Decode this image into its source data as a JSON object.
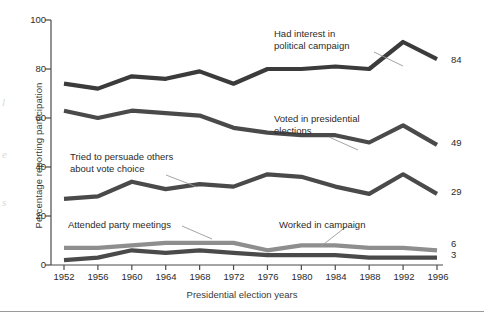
{
  "chart_data": {
    "type": "line",
    "title": "",
    "xlabel": "Presidential election years",
    "ylabel": "Percentage reporting participation",
    "categories": [
      "1952",
      "1956",
      "1960",
      "1964",
      "1968",
      "1972",
      "1976",
      "1980",
      "1984",
      "1988",
      "1992",
      "1996"
    ],
    "x": [
      1952,
      1956,
      1960,
      1964,
      1968,
      1972,
      1976,
      1980,
      1984,
      1988,
      1992,
      1996
    ],
    "ylim": [
      0,
      100
    ],
    "xlim": [
      1952,
      1996
    ],
    "yticks": [
      0,
      20,
      40,
      60,
      80,
      100
    ],
    "ytick_labels": [
      "0",
      "20",
      "40",
      "60",
      "80",
      "100"
    ],
    "grid": false,
    "legend_position": "inline-annotations",
    "series": [
      {
        "name": "Had interest in political campaign",
        "color": "#3b3b3b",
        "values": [
          74,
          72,
          77,
          76,
          79,
          74,
          80,
          80,
          81,
          80,
          91,
          84
        ],
        "end_label": "84"
      },
      {
        "name": "Voted in presidential elections",
        "color": "#4a4a4a",
        "values": [
          63,
          60,
          63,
          62,
          61,
          56,
          54,
          53,
          53,
          50,
          57,
          49
        ],
        "end_label": "49"
      },
      {
        "name": "Tried to persuade others about vote choice",
        "color": "#4a4a4a",
        "values": [
          27,
          28,
          34,
          31,
          33,
          32,
          37,
          36,
          32,
          29,
          37,
          29
        ],
        "end_label": "29"
      },
      {
        "name": "Attended party meetings",
        "color": "#8e8e8e",
        "values": [
          7,
          7,
          8,
          9,
          9,
          9,
          6,
          8,
          8,
          7,
          7,
          6
        ],
        "end_label": "6"
      },
      {
        "name": "Worked in campaign",
        "color": "#4a4a4a",
        "values": [
          2,
          3,
          6,
          5,
          6,
          5,
          4,
          4,
          4,
          3,
          3,
          3
        ],
        "end_label": "3"
      }
    ],
    "annotations": [
      {
        "text_lines": [
          "Had interest in",
          "political campaign"
        ],
        "target_series": "Had interest in political campaign"
      },
      {
        "text_lines": [
          "Voted in presidential",
          "elections"
        ],
        "target_series": "Voted in presidential elections"
      },
      {
        "text_lines": [
          "Tried to persuade others",
          "about vote choice"
        ],
        "target_series": "Tried to persuade others about vote choice"
      },
      {
        "text_lines": [
          "Attended party meetings"
        ],
        "target_series": "Attended party meetings"
      },
      {
        "text_lines": [
          "Worked in campaign"
        ],
        "target_series": "Worked in campaign"
      }
    ]
  },
  "labels": {
    "y_axis_title": "Percentage reporting participation",
    "x_axis_title": "Presidential election years",
    "y_ticks": [
      "100",
      "80",
      "60",
      "40",
      "20",
      "0"
    ],
    "x_ticks": [
      "1952",
      "1956",
      "1960",
      "1964",
      "1968",
      "1972",
      "1976",
      "1980",
      "1984",
      "1988",
      "1992",
      "1996"
    ],
    "end_values": [
      "84",
      "49",
      "29",
      "6",
      "3"
    ],
    "anno_interest_l1": "Had interest in",
    "anno_interest_l2": "political campaign",
    "anno_voted_l1": "Voted in presidential",
    "anno_voted_l2": "elections",
    "anno_persuade_l1": "Tried to persuade others",
    "anno_persuade_l2": "about vote choice",
    "anno_meetings": "Attended party meetings",
    "anno_worked": "Worked in campaign"
  },
  "bleed_text": {
    "line1": "l",
    "line2": "e",
    "line3": "s"
  },
  "colors": {
    "series_dark": "#3b3b3b",
    "series_mid": "#4a4a4a",
    "series_light": "#8e8e8e",
    "axis": "#4a4a4a",
    "text": "#2b2b2b",
    "background": "#ffffff"
  }
}
